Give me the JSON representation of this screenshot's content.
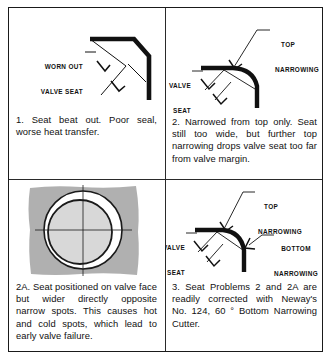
{
  "figure": {
    "frame_color": "#1a1a1a",
    "background_color": "#ffffff",
    "valve_face_gray": "#b0b0b0"
  },
  "panels": [
    {
      "id": "panel-1",
      "number": "1.",
      "labels": [
        {
          "name": "worn-out-valve-seat",
          "line1": "WORN OUT",
          "line2": "VALVE SEAT"
        }
      ],
      "caption": "1.  Seat beat out. Poor seal, worse heat transfer."
    },
    {
      "id": "panel-2",
      "number": "2.",
      "labels": [
        {
          "name": "top-narrowing",
          "line1": "TOP",
          "line2": "NARROWING"
        },
        {
          "name": "valve-seat",
          "line1": "VALVE",
          "line2": "SEAT"
        }
      ],
      "caption": "2.  Narrowed from top only. Seat still too wide, but further top narrowing drops valve seat too far from valve margin."
    },
    {
      "id": "panel-3",
      "number": "2A.",
      "labels": [],
      "caption": "2A.  Seat positioned on valve face but wider directly opposite narrow spots. This causes hot and cold spots, which lead to early valve failure."
    },
    {
      "id": "panel-4",
      "number": "3.",
      "labels": [
        {
          "name": "top-narrowing",
          "line1": "TOP",
          "line2": "NARROWING"
        },
        {
          "name": "valve-seat",
          "line1": "VALVE",
          "line2": "SEAT"
        },
        {
          "name": "bottom-narrowing",
          "line1": "BOTTOM",
          "line2": "NARROWING"
        }
      ],
      "caption": "3.  Seat Problems 2 and 2A are readily corrected with Neway's No. 124, 60 ° Bottom Narrowing Cutter."
    }
  ]
}
